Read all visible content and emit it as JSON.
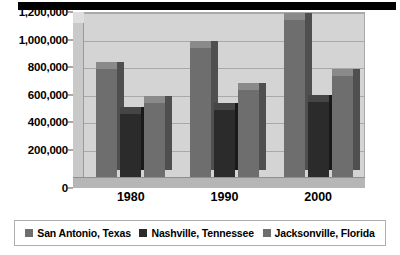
{
  "header": {
    "accent_color": "#000000"
  },
  "chart_data": {
    "type": "bar",
    "title": "",
    "subtitle": "",
    "xlabel": "",
    "ylabel": "",
    "categories": [
      "1980",
      "1990",
      "2000"
    ],
    "series": [
      {
        "name": "San Antonio, Texas",
        "color": "#6e6e6e",
        "values": [
          785000,
          935000,
          1145000
        ]
      },
      {
        "name": "Nashville, Tennessee",
        "color": "#2b2b2b",
        "values": [
          455000,
          490000,
          545000
        ]
      },
      {
        "name": "Jacksonville, Florida",
        "color": "#6e6e6e",
        "values": [
          540000,
          635000,
          735000
        ]
      }
    ],
    "ylim": [
      0,
      1200000
    ],
    "ytick_values": [
      0,
      200000,
      400000,
      600000,
      800000,
      1000000,
      1200000
    ],
    "ytick_labels": [
      "0",
      "200,000",
      "400,000",
      "600,000",
      "800,000",
      "1,000,000",
      "1,200,000"
    ],
    "grid": true,
    "legend_position": "bottom",
    "style": "3d-column",
    "plot_background": "#d4d4d4",
    "gridline_color": "#a9a9a9"
  },
  "legend": {
    "items": [
      {
        "label": "San Antonio, Texas",
        "color": "#6e6e6e"
      },
      {
        "label": "Nashville, Tennessee",
        "color": "#2b2b2b"
      },
      {
        "label": "Jacksonville, Florida",
        "color": "#6e6e6e"
      }
    ]
  }
}
